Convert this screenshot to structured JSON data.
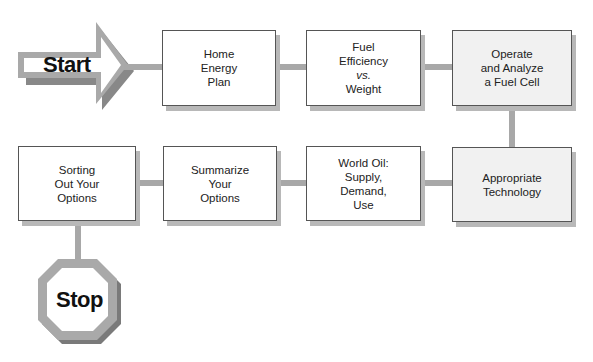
{
  "diagram": {
    "type": "flowchart",
    "start": {
      "label": "Start",
      "shape": "arrow"
    },
    "stop": {
      "label": "Stop",
      "shape": "octagon"
    },
    "steps": [
      {
        "id": "home-energy-plan",
        "lines": [
          "Home",
          "Energy",
          "Plan"
        ],
        "shaded": false
      },
      {
        "id": "fuel-efficiency",
        "lines": [
          "Fuel",
          "Efficiency",
          "vs.",
          "Weight"
        ],
        "italic_line": 2,
        "shaded": false
      },
      {
        "id": "fuel-cell",
        "lines": [
          "Operate",
          "and Analyze",
          "a Fuel Cell"
        ],
        "shaded": true
      },
      {
        "id": "appropriate-technology",
        "lines": [
          "Appropriate",
          "Technology"
        ],
        "shaded": true
      },
      {
        "id": "world-oil",
        "lines": [
          "World Oil:",
          "Supply,",
          "Demand,",
          "Use"
        ],
        "shaded": false
      },
      {
        "id": "summarize",
        "lines": [
          "Summarize",
          "Your",
          "Options"
        ],
        "shaded": false
      },
      {
        "id": "sorting",
        "lines": [
          "Sorting",
          "Out Your",
          "Options"
        ],
        "shaded": false
      }
    ],
    "flow": [
      "Start",
      "Home Energy Plan",
      "Fuel Efficiency vs. Weight",
      "Operate and Analyze a Fuel Cell",
      "Appropriate Technology",
      "World Oil: Supply, Demand, Use",
      "Summarize Your Options",
      "Sorting Out Your Options",
      "Stop"
    ],
    "colors": {
      "connector": "#a8a8a8",
      "connector_dark": "#7a7a7a",
      "box_border": "#555555",
      "shaded_box": "#f1f1f1",
      "shadow": "#b8b8b8"
    }
  }
}
